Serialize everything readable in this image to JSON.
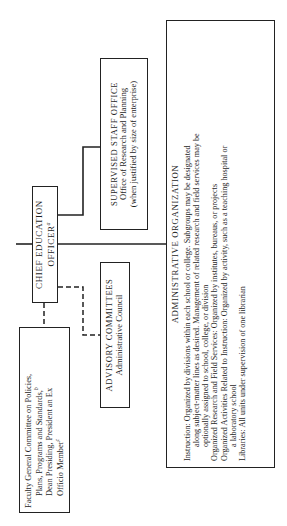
{
  "diagram": {
    "ceo": {
      "line1": "CHIEF EDUCATION",
      "line2": "OFFICER",
      "footnote": "a"
    },
    "supervised_staff_office": {
      "title": "SUPERVISED STAFF OFFICE",
      "line1": "Office of Research and Planning",
      "line2": "(when justified by size of enterprise)"
    },
    "advisory_committees": {
      "title": "ADVISORY COMMITTEES",
      "line1": "Administrative Council"
    },
    "faculty_committee": {
      "line1": "Faculty General Committee on Policies,",
      "line2": "Plans, Programs and Standards,",
      "line2_footnote": "b",
      "line3": "Dean Presiding, President an Ex",
      "line4": "Officio Member",
      "line4_footnote": "c"
    },
    "administrative_organization": {
      "title": "ADMINISTRATIVE ORGANIZATION",
      "lines": [
        {
          "text": "Instruction: Organized by divisions within each school or college. Subgroups may be designated",
          "indent": false
        },
        {
          "text": "along subject-matter lines as desired. Management of related research and field services may be",
          "indent": true
        },
        {
          "text": "optionally assigned to school, college, or division",
          "indent": true
        },
        {
          "text": "Organized Research and Field Services: Organized by institutes, bureaus, or projects",
          "indent": false
        },
        {
          "text": "Organized Activities Related to Instruction: Organized by activity, such as a teaching hospital or",
          "indent": false
        },
        {
          "text": "a laboratory school",
          "indent": true
        },
        {
          "text": "Libraries: All units under supervision of one librarian",
          "indent": false
        }
      ]
    },
    "connectors": {
      "solid_color": "#222222",
      "dashed_color": "#222222"
    }
  }
}
